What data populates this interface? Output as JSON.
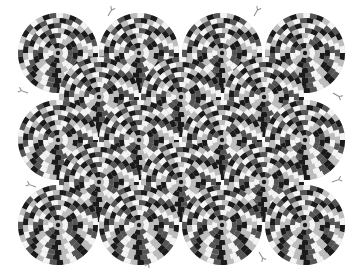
{
  "image": {
    "title": "Rotating snakes optical illusion",
    "width": 362,
    "height": 280,
    "background": "#ffffff"
  },
  "palette": {
    "black": "#1a1a1a",
    "dark_gray": "#555555",
    "light_gray": "#bdbdbd",
    "white": "#f4f4f4",
    "tongue": "#8a8a8a"
  },
  "disc": {
    "radius": 40,
    "rings": 8,
    "segments_base": 22,
    "center_dot_radius": 2.2
  },
  "discs": [
    {
      "x": 58,
      "y": 53,
      "dir": 1
    },
    {
      "x": 139,
      "y": 53,
      "dir": -1
    },
    {
      "x": 222,
      "y": 53,
      "dir": 1
    },
    {
      "x": 305,
      "y": 53,
      "dir": -1
    },
    {
      "x": 99,
      "y": 97,
      "dir": -1
    },
    {
      "x": 181,
      "y": 97,
      "dir": 1
    },
    {
      "x": 264,
      "y": 97,
      "dir": -1
    },
    {
      "x": 58,
      "y": 140,
      "dir": -1
    },
    {
      "x": 139,
      "y": 140,
      "dir": 1
    },
    {
      "x": 222,
      "y": 140,
      "dir": -1
    },
    {
      "x": 305,
      "y": 140,
      "dir": 1
    },
    {
      "x": 99,
      "y": 182,
      "dir": 1
    },
    {
      "x": 181,
      "y": 182,
      "dir": -1
    },
    {
      "x": 264,
      "y": 182,
      "dir": 1
    },
    {
      "x": 58,
      "y": 225,
      "dir": 1
    },
    {
      "x": 139,
      "y": 225,
      "dir": -1
    },
    {
      "x": 222,
      "y": 225,
      "dir": 1
    },
    {
      "x": 305,
      "y": 225,
      "dir": -1
    }
  ],
  "tongues": [
    {
      "x": 108,
      "y": 16,
      "angle": -60
    },
    {
      "x": 254,
      "y": 16,
      "angle": -60
    },
    {
      "x": 28,
      "y": 93,
      "angle": 200
    },
    {
      "x": 152,
      "y": 258,
      "angle": 120
    },
    {
      "x": 36,
      "y": 187,
      "angle": 200
    },
    {
      "x": 332,
      "y": 182,
      "angle": -20
    },
    {
      "x": 333,
      "y": 93,
      "angle": 30
    },
    {
      "x": 259,
      "y": 252,
      "angle": 60
    }
  ]
}
